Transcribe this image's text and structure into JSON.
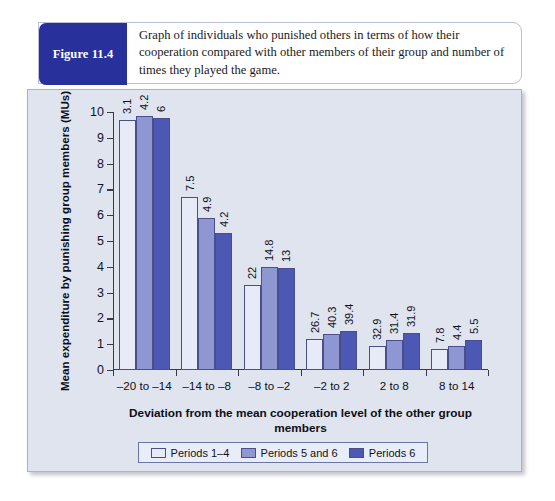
{
  "figure": {
    "badge_label": "Figure 11.4",
    "caption": "Graph of individuals who punished others in terms of how their cooperation compared with other members of their group and number of times they played the game."
  },
  "chart_data": {
    "type": "bar",
    "title": "",
    "xlabel": "Deviation from the mean cooperation level of the other group members",
    "ylabel": "Mean expenditure by punishing group members (MUs)",
    "categories": [
      "–20 to –14",
      "–14 to –8",
      "–8 to –2",
      "–2 to 2",
      "2 to 8",
      "8 to 14"
    ],
    "ylim": [
      0,
      10
    ],
    "yticks": [
      "0",
      "1",
      "2",
      "3",
      "4",
      "5",
      "6",
      "7",
      "8",
      "9",
      "10"
    ],
    "grid": false,
    "legend_position": "bottom",
    "series": [
      {
        "name": "Periods 1–4",
        "color": "#e7ebf7",
        "values": [
          9.7,
          6.7,
          3.3,
          1.2,
          0.95,
          0.8
        ],
        "labels": [
          "3.1",
          "7.5",
          "22",
          "26.7",
          "32.9",
          "7.8"
        ]
      },
      {
        "name": "Periods 5 and 6",
        "color": "#8e97d2",
        "values": [
          9.85,
          5.9,
          4.0,
          1.4,
          1.15,
          0.95
        ],
        "labels": [
          "4.2",
          "4.9",
          "14.8",
          "40.3",
          "31.4",
          "4.4"
        ]
      },
      {
        "name": "Periods 6",
        "color": "#4d58b4",
        "values": [
          9.75,
          5.3,
          3.95,
          1.5,
          1.45,
          1.15
        ],
        "labels": [
          "6",
          "4.2",
          "13",
          "39.4",
          "31.9",
          "5.5"
        ]
      }
    ]
  }
}
